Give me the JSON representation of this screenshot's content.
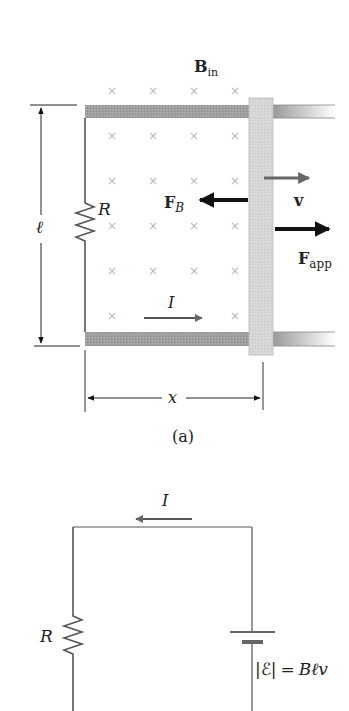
{
  "figure_a": {
    "field_label": "B",
    "field_subscript": "in",
    "length_label": "ℓ",
    "resistor_label": "R",
    "magnetic_force_label": "F",
    "magnetic_force_subscript": "B",
    "velocity_label": "v",
    "applied_force_label": "F",
    "applied_force_subscript": "app",
    "current_label": "I",
    "distance_label": "x",
    "caption": "(a)",
    "field_marker": "×"
  },
  "figure_b": {
    "current_label": "I",
    "resistor_label": "R",
    "emf_equation_lhs": "|ℰ|",
    "emf_equation_eq": "=",
    "emf_equation_rhs": "Bℓv"
  },
  "colors": {
    "rail": "#9a9a9a",
    "bar": "#d4d4d4",
    "field_marker": "#b8b8b8",
    "arrow_dark": "#111111",
    "arrow_gray": "#666666",
    "wire": "#555555"
  }
}
